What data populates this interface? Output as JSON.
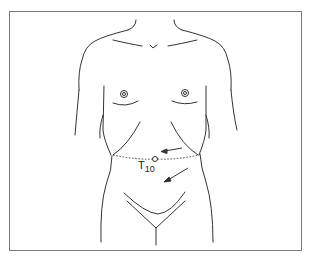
{
  "diagram": {
    "landmark": {
      "label_main": "T",
      "label_sub": "10",
      "description": "umbilicus marker with dotted dermatome line"
    },
    "arrows": [
      {
        "name": "upper-arrow",
        "direction": "left"
      },
      {
        "name": "lower-arrow",
        "direction": "down-left"
      }
    ],
    "colors": {
      "line": "#333333",
      "frame": "#7a7a7a",
      "background": "#ffffff"
    }
  }
}
